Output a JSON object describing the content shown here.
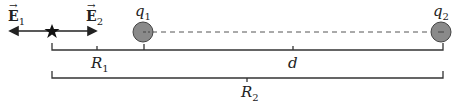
{
  "labels": {
    "E1": {
      "base": "E",
      "sub": "1",
      "arrow": "→"
    },
    "E2": {
      "base": "E",
      "sub": "2",
      "arrow": "→"
    },
    "q1": {
      "base": "q",
      "sub": "1"
    },
    "q2": {
      "base": "q",
      "sub": "2"
    },
    "R1": {
      "base": "R",
      "sub": "1"
    },
    "R2": {
      "base": "R",
      "sub": "2"
    },
    "d": {
      "base": "d"
    }
  },
  "colors": {
    "charge_fill": "#8a8a8a",
    "line": "#333333"
  }
}
